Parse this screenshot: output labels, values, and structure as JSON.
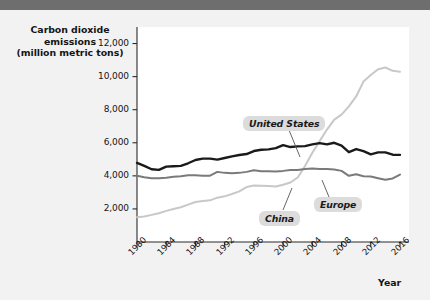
{
  "header": {
    "title": "Growth"
  },
  "chart_data": {
    "type": "line",
    "title": "Growth",
    "ylabel_line1": "Carbon dioxide emissions",
    "ylabel_line2": "(million metric tons)",
    "xlabel": "Year",
    "ylim": [
      0,
      13000
    ],
    "xlim": [
      1980,
      2016
    ],
    "yticks": [
      2000,
      4000,
      6000,
      8000,
      10000,
      12000
    ],
    "ytick_labels": [
      "2,000",
      "4,000",
      "6,000",
      "8,000",
      "10,000",
      "12,000"
    ],
    "xticks": [
      1980,
      1984,
      1988,
      1992,
      1996,
      2000,
      2004,
      2008,
      2012,
      2016
    ],
    "xtick_labels": [
      "1980",
      "1984",
      "1988",
      "1992",
      "1996",
      "2000",
      "2004",
      "2008",
      "2012",
      "2016"
    ],
    "grid": false,
    "legend_position": "inline-callouts",
    "x": [
      1980,
      1981,
      1982,
      1983,
      1984,
      1985,
      1986,
      1987,
      1988,
      1989,
      1990,
      1991,
      1992,
      1993,
      1994,
      1995,
      1996,
      1997,
      1998,
      1999,
      2000,
      2001,
      2002,
      2003,
      2004,
      2005,
      2006,
      2007,
      2008,
      2009,
      2010,
      2011,
      2012,
      2013,
      2014,
      2015,
      2016
    ],
    "series": [
      {
        "name": "United States",
        "color": "#1a1a1a",
        "label_text": "United States",
        "values": [
          4780,
          4600,
          4400,
          4360,
          4560,
          4580,
          4600,
          4760,
          4960,
          5040,
          5040,
          4980,
          5080,
          5180,
          5260,
          5320,
          5500,
          5580,
          5600,
          5680,
          5860,
          5740,
          5780,
          5800,
          5900,
          5980,
          5900,
          6000,
          5830,
          5430,
          5620,
          5500,
          5300,
          5420,
          5420,
          5280,
          5270
        ]
      },
      {
        "name": "Europe",
        "color": "#7a7a7a",
        "label_text": "Europe",
        "values": [
          4000,
          3920,
          3860,
          3860,
          3880,
          3940,
          3980,
          4040,
          4040,
          4000,
          4010,
          4240,
          4180,
          4160,
          4180,
          4240,
          4340,
          4280,
          4280,
          4260,
          4300,
          4360,
          4360,
          4420,
          4440,
          4420,
          4420,
          4380,
          4300,
          4000,
          4100,
          3980,
          3960,
          3860,
          3760,
          3840,
          4080
        ]
      },
      {
        "name": "China",
        "color": "#c8c8c8",
        "label_text": "China",
        "values": [
          1500,
          1540,
          1640,
          1740,
          1880,
          2000,
          2100,
          2260,
          2420,
          2480,
          2520,
          2680,
          2760,
          2900,
          3060,
          3320,
          3420,
          3400,
          3380,
          3360,
          3460,
          3600,
          3900,
          4600,
          5400,
          6100,
          6800,
          7400,
          7700,
          8200,
          8800,
          9700,
          10100,
          10450,
          10550,
          10350,
          10300
        ]
      }
    ]
  }
}
